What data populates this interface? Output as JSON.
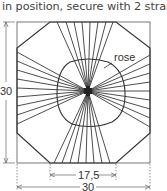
{
  "caption": "in position, secure with 2 strands",
  "labels": {
    "rose": "rose",
    "height": "30",
    "inner_width": "17,5",
    "outer_width": "30"
  },
  "colors": {
    "line": "#3a3a3a",
    "dimension": "#666666",
    "background": "#ffffff"
  },
  "geometry": {
    "square": {
      "x": 17,
      "y": 22,
      "w": 133,
      "h": 141
    },
    "center": {
      "x": 88,
      "y": 91
    },
    "octagon": [
      [
        50,
        22
      ],
      [
        116,
        22
      ],
      [
        150,
        48
      ],
      [
        150,
        133
      ],
      [
        116,
        163
      ],
      [
        50,
        163
      ],
      [
        17,
        133
      ],
      [
        17,
        48
      ]
    ]
  }
}
